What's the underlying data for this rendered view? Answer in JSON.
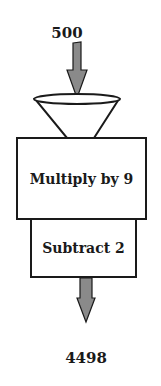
{
  "diagram": {
    "type": "function-machine",
    "input": {
      "label": "500"
    },
    "steps": [
      {
        "label": "Multiply by 9"
      },
      {
        "label": "Subtract 2"
      }
    ],
    "output": {
      "label": "4498"
    },
    "colors": {
      "arrow_fill": "#8a8a8a",
      "stroke": "#1a1a1a",
      "background": "#ffffff"
    }
  }
}
